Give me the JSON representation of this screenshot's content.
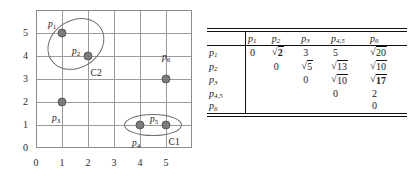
{
  "chart_data": {
    "type": "scatter",
    "title": "",
    "xlabel": "",
    "ylabel": "",
    "xlim": [
      0,
      6
    ],
    "ylim": [
      0,
      6
    ],
    "grid": true,
    "legend": "none",
    "x_ticks": [
      "0",
      "1",
      "2",
      "3",
      "4",
      "5"
    ],
    "y_ticks": [
      "0",
      "1",
      "2",
      "3",
      "4",
      "5"
    ],
    "point_color": "#7c7c7c",
    "points": [
      {
        "label": "p1",
        "sub": "1",
        "x": 1,
        "y": 5,
        "label_dx": -14,
        "label_dy": -13
      },
      {
        "label": "p2",
        "sub": "2",
        "x": 2,
        "y": 4,
        "label_dx": -16,
        "label_dy": -9
      },
      {
        "label": "p3",
        "sub": "3",
        "x": 1,
        "y": 2,
        "label_dx": -10,
        "label_dy": 12
      },
      {
        "label": "p4",
        "sub": "4",
        "x": 4,
        "y": 1,
        "label_dx": -8,
        "label_dy": 14
      },
      {
        "label": "p5",
        "sub": "5",
        "x": 5,
        "y": 1,
        "label_dx": -16,
        "label_dy": -10
      },
      {
        "label": "p6",
        "sub": "6",
        "x": 5,
        "y": 3,
        "label_dx": -4,
        "label_dy": -26
      }
    ],
    "clusters": [
      {
        "name": "C2",
        "members": [
          "p1",
          "p2"
        ],
        "cx": 1.55,
        "cy": 4.5,
        "rx": 1.15,
        "ry": 1.05,
        "rotate": -32,
        "label_x": 2.1,
        "label_y": 3.45
      },
      {
        "name": "C1",
        "members": [
          "p4",
          "p5"
        ],
        "cx": 4.5,
        "cy": 1.0,
        "rx": 1.1,
        "ry": 0.48,
        "rotate": 0,
        "label_x": 5.1,
        "label_y": 0.45
      }
    ]
  },
  "matrix": {
    "caption": "",
    "columns": [
      "p1",
      "p2",
      "p3",
      "p4,p5",
      "p6"
    ],
    "column_subs": [
      "1",
      "2",
      "3",
      "4,5",
      "6"
    ],
    "row_labels": [
      "p1",
      "p2",
      "p3",
      "p4,p5",
      "p6"
    ],
    "row_subs": [
      "1",
      "2",
      "3",
      "4,5",
      "6"
    ],
    "rows": [
      {
        "label": "p1",
        "cells": [
          {
            "text": "0",
            "kind": "plain"
          },
          {
            "text": "2",
            "kind": "sqrt",
            "bold": true
          },
          {
            "text": "3",
            "kind": "plain"
          },
          {
            "text": "5",
            "kind": "plain"
          },
          {
            "text": "20",
            "kind": "sqrt",
            "bold": false
          }
        ]
      },
      {
        "label": "p2",
        "cells": [
          {
            "text": "",
            "kind": "empty"
          },
          {
            "text": "0",
            "kind": "plain"
          },
          {
            "text": "5",
            "kind": "sqrt",
            "bold": false
          },
          {
            "text": "13",
            "kind": "sqrt",
            "bold": false
          },
          {
            "text": "10",
            "kind": "sqrt",
            "bold": false
          }
        ]
      },
      {
        "label": "p3",
        "cells": [
          {
            "text": "",
            "kind": "empty"
          },
          {
            "text": "",
            "kind": "empty"
          },
          {
            "text": "0",
            "kind": "plain"
          },
          {
            "text": "10",
            "kind": "sqrt",
            "bold": false
          },
          {
            "text": "17",
            "kind": "sqrt",
            "bold": true
          }
        ]
      },
      {
        "label": "p4,p5",
        "cells": [
          {
            "text": "",
            "kind": "empty"
          },
          {
            "text": "",
            "kind": "empty"
          },
          {
            "text": "",
            "kind": "empty"
          },
          {
            "text": "0",
            "kind": "plain"
          },
          {
            "text": "2",
            "kind": "plain"
          }
        ]
      },
      {
        "label": "p6",
        "cells": [
          {
            "text": "",
            "kind": "empty"
          },
          {
            "text": "",
            "kind": "empty"
          },
          {
            "text": "",
            "kind": "empty"
          },
          {
            "text": "",
            "kind": "empty"
          },
          {
            "text": "0",
            "kind": "plain"
          }
        ]
      }
    ]
  }
}
